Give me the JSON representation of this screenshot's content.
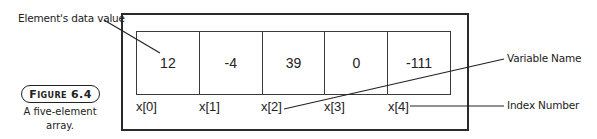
{
  "figure": {
    "badge": "Figure 6.4",
    "caption": "A five-element array."
  },
  "array": {
    "name": "x",
    "cells": [
      {
        "value": "12",
        "index_label": "x[0]"
      },
      {
        "value": "-4",
        "index_label": "x[1]"
      },
      {
        "value": "39",
        "index_label": "x[2]"
      },
      {
        "value": "0",
        "index_label": "x[3]"
      },
      {
        "value": "-111",
        "index_label": "x[4]"
      }
    ]
  },
  "callouts": {
    "data_value": "Element's data value",
    "variable_name": "Variable Name",
    "index_number": "Index Number"
  },
  "colors": {
    "line": "#222222",
    "background": "#ffffff"
  }
}
